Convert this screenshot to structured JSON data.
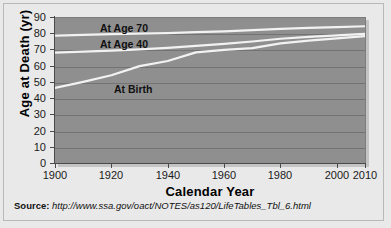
{
  "chart_data": {
    "type": "line",
    "title": "",
    "xlabel": "Calendar Year",
    "ylabel": "Age at Death (yr)",
    "xlim": [
      1900,
      2010
    ],
    "ylim": [
      0,
      90
    ],
    "grid": true,
    "legend_position": "inline-annotations",
    "xticks": [
      1900,
      1920,
      1940,
      1960,
      1980,
      2000,
      2010
    ],
    "xtick_labels": [
      "1900",
      "1920",
      "1940",
      "1960",
      "1980",
      "2000",
      "2010"
    ],
    "yticks": [
      0,
      10,
      20,
      30,
      40,
      50,
      60,
      70,
      80,
      90
    ],
    "ytick_labels": [
      "0",
      "10",
      "20",
      "30",
      "40",
      "50",
      "60",
      "70",
      "80",
      "90"
    ],
    "x": [
      1900,
      1910,
      1920,
      1930,
      1940,
      1950,
      1960,
      1970,
      1980,
      1990,
      2000,
      2010
    ],
    "series": [
      {
        "name": "At Age 70",
        "label": "At Age 70",
        "color": "#f2f2f2",
        "values": [
          78.5,
          79.0,
          79.4,
          79.7,
          80.1,
          80.7,
          81.2,
          81.9,
          82.7,
          83.3,
          83.8,
          84.3
        ]
      },
      {
        "name": "At Age 40",
        "label": "At Age 40",
        "color": "#f2f2f2",
        "values": [
          68.0,
          68.6,
          69.3,
          70.0,
          71.0,
          72.2,
          73.4,
          74.9,
          76.6,
          77.8,
          78.7,
          79.6
        ]
      },
      {
        "name": "At Birth",
        "label": "At Birth",
        "color": "#f2f2f2",
        "values": [
          46.3,
          50.0,
          54.1,
          59.7,
          62.9,
          68.2,
          69.7,
          70.8,
          73.7,
          75.4,
          76.8,
          78.2
        ]
      }
    ]
  },
  "annotations": {
    "at_age_70": "At Age 70",
    "at_age_40": "At Age 40",
    "at_birth": "At Birth"
  },
  "source": {
    "prefix": "Source:",
    "url": "http://www.ssa.gov/oact/NOTES/as120/LifeTables_Tbl_6.html"
  },
  "colors": {
    "plot_background": "#8f8f8f",
    "figure_background": "#e9e9e9",
    "gridline": "#6f6f6f",
    "series_line": "#f2f2f2",
    "axis": "#4a4a4a",
    "text": "#111111"
  }
}
